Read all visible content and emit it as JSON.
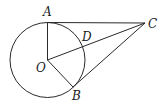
{
  "diagram": {
    "type": "geometry",
    "circle": {
      "center": "O",
      "cx": 47.5,
      "cy": 60,
      "r": 37.5
    },
    "points": {
      "A": {
        "x": 47.5,
        "y": 22.5,
        "label": "A",
        "lx": 43,
        "ly": 16
      },
      "B": {
        "x": 73,
        "y": 87,
        "label": "B",
        "lx": 72,
        "ly": 100
      },
      "C": {
        "x": 145,
        "y": 23,
        "label": "C",
        "lx": 148,
        "ly": 28
      },
      "D": {
        "x": 82,
        "y": 47,
        "label": "D",
        "lx": 82,
        "ly": 41
      },
      "O": {
        "x": 47.5,
        "y": 60,
        "label": "O",
        "lx": 36,
        "ly": 72
      }
    },
    "segments": [
      [
        "A",
        "C"
      ],
      [
        "O",
        "C"
      ],
      [
        "B",
        "C"
      ],
      [
        "O",
        "A"
      ],
      [
        "O",
        "B"
      ]
    ]
  }
}
